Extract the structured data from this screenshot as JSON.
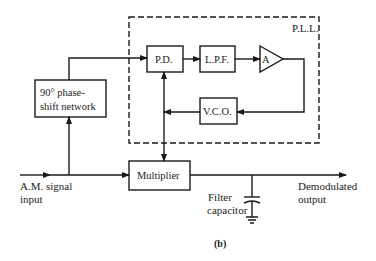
{
  "figure": {
    "caption": "(b)",
    "pll_label": "P.L.L.",
    "blocks": {
      "phase_shift": {
        "line1": "90° phase-",
        "line2": "shift network"
      },
      "phase_detector": "P.D.",
      "low_pass_filter": "L.P.F.",
      "amplifier": "A",
      "vco": "V.C.O.",
      "multiplier": "Multiplier"
    },
    "labels": {
      "input_line1": "A.M. signal",
      "input_line2": "input",
      "capacitor_line1": "Filter",
      "capacitor_line2": "capacitor",
      "output_line1": "Demodulated",
      "output_line2": "output"
    },
    "colors": {
      "line": "#1a1a1a",
      "background": "#ffffff"
    }
  }
}
